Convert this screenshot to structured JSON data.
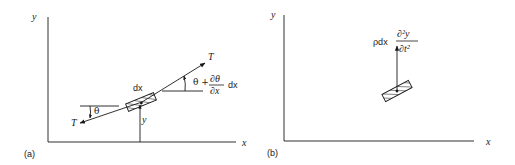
{
  "figure": {
    "panels": [
      {
        "id": "a",
        "caption": "(a)",
        "axis_x_label": "x",
        "axis_y_label": "y",
        "tension_left_label": "T",
        "tension_right_label": "T",
        "element_label": "dx",
        "displacement_label": "y",
        "angle_left_label": "θ",
        "angle_right_prefix": "θ +",
        "angle_right_frac_num": "∂θ",
        "angle_right_frac_den": "∂x",
        "angle_right_suffix": "dx"
      },
      {
        "id": "b",
        "caption": "(b)",
        "axis_x_label": "x",
        "axis_y_label": "y",
        "force_prefix": "ρdx",
        "force_frac_num": "∂²y",
        "force_frac_den": "∂t²"
      }
    ],
    "colors": {
      "ink": "#1a1a1a",
      "background": "#ffffff"
    }
  }
}
